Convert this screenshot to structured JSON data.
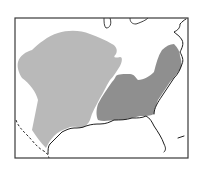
{
  "map": {
    "title": "",
    "extent": "Central and Eastern United States",
    "colors": {
      "background": "#ffffff",
      "frame": "#3a3a3a",
      "region_west": "#b9b9b9",
      "region_east": "#8f8f8f",
      "coastline": "#1e1e1e"
    },
    "regions": [
      {
        "id": "west",
        "label": "",
        "shade": "light gray"
      },
      {
        "id": "east",
        "label": "",
        "shade": "dark gray"
      }
    ],
    "features": [
      "Gulf of Mexico coastline",
      "Atlantic coastline",
      "Florida peninsula",
      "Great Lakes outlines",
      "Mexico border (dashed)"
    ]
  }
}
